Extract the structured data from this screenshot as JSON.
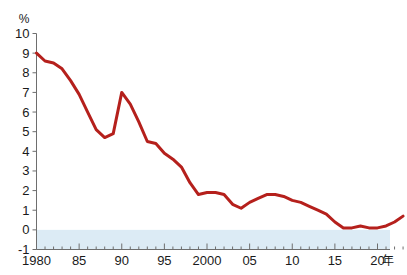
{
  "chart_data": {
    "type": "line",
    "title": "",
    "subtitle": "",
    "xlabel": "年",
    "ylabel": "%",
    "ylim": [
      -1,
      10
    ],
    "xlim": [
      1980,
      2023
    ],
    "grid": false,
    "legend": null,
    "y_ticks": [
      10,
      9,
      8,
      7,
      6,
      5,
      4,
      3,
      2,
      1,
      0,
      -1
    ],
    "y_tick_labels": [
      "10",
      "9",
      "8",
      "7",
      "6",
      "5",
      "4",
      "3",
      "2",
      "1",
      "0",
      "-1"
    ],
    "x_ticks": [
      1980,
      1985,
      1990,
      1995,
      2000,
      2005,
      2010,
      2015,
      2020
    ],
    "x_tick_labels": [
      "1980",
      "85",
      "90",
      "95",
      "2000",
      "05",
      "10",
      "15",
      "20"
    ],
    "x_minor_tick_step": 1,
    "negative_band": {
      "from": -1,
      "to": 0,
      "color": "#dcebf5"
    },
    "series": [
      {
        "name": "",
        "color": "#b5201c",
        "line_width": 3,
        "x": [
          1980,
          1981,
          1982,
          1983,
          1984,
          1985,
          1986,
          1987,
          1988,
          1989,
          1990,
          1991,
          1992,
          1993,
          1994,
          1995,
          1996,
          1997,
          1998,
          1999,
          2000,
          2001,
          2002,
          2003,
          2004,
          2005,
          2006,
          2007,
          2008,
          2009,
          2010,
          2011,
          2012,
          2013,
          2014,
          2015,
          2016,
          2017,
          2018,
          2019,
          2020,
          2021,
          2022,
          2023
        ],
        "values": [
          9.0,
          8.6,
          8.5,
          8.2,
          7.6,
          6.9,
          6.0,
          5.1,
          4.7,
          4.9,
          7.0,
          6.4,
          5.5,
          4.5,
          4.4,
          3.9,
          3.6,
          3.2,
          2.4,
          1.8,
          1.9,
          1.9,
          1.8,
          1.3,
          1.1,
          1.4,
          1.6,
          1.8,
          1.8,
          1.7,
          1.5,
          1.4,
          1.2,
          1.0,
          0.8,
          0.4,
          0.1,
          0.1,
          0.2,
          0.1,
          0.1,
          0.2,
          0.4,
          0.7
        ]
      }
    ]
  },
  "axis": {
    "y_unit": "%",
    "x_unit": "年"
  }
}
